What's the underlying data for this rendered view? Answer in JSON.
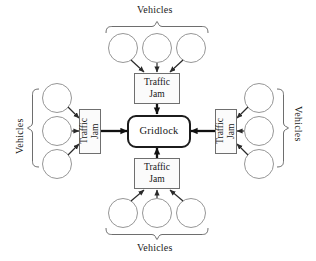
{
  "diagram": {
    "title_text_font_style": "serif",
    "center_node": {
      "label": "Gridlock",
      "shape": "rounded-rectangle",
      "border_color": "#1c1c1c",
      "fill_color": "#ffffff"
    },
    "group_label": "Vehicles",
    "jam_label_line1": "Traffic",
    "jam_label_line2": "Jam",
    "colors": {
      "circle_stroke": "#8a8a8a",
      "box_stroke": "#6f6f6f",
      "brace_stroke": "#5e5e5e",
      "arrow_thin": "#2a2a2a",
      "arrow_thick": "#111111",
      "text": "#1a1a1a",
      "background": "#ffffff"
    },
    "branches": [
      {
        "id": "top",
        "position": "top",
        "group_label": "Vehicles",
        "jam_label_line1": "Traffic",
        "jam_label_line2": "Jam",
        "vehicle_count": 3,
        "text_orientation": "horizontal",
        "arrow_into_center_direction": "down"
      },
      {
        "id": "left",
        "position": "left",
        "group_label": "Vehicles",
        "jam_label_line1": "Traffic",
        "jam_label_line2": "Jam",
        "vehicle_count": 3,
        "text_orientation": "vertical-ccw",
        "arrow_into_center_direction": "right"
      },
      {
        "id": "right",
        "position": "right",
        "group_label": "Vehicles",
        "jam_label_line1": "Traffic",
        "jam_label_line2": "Jam",
        "vehicle_count": 3,
        "text_orientation": "vertical-cw",
        "arrow_into_center_direction": "left"
      },
      {
        "id": "bottom",
        "position": "bottom",
        "group_label": "Vehicles",
        "jam_label_line1": "Traffic",
        "jam_label_line2": "Jam",
        "vehicle_count": 3,
        "text_orientation": "horizontal",
        "arrow_into_center_direction": "up"
      }
    ]
  }
}
